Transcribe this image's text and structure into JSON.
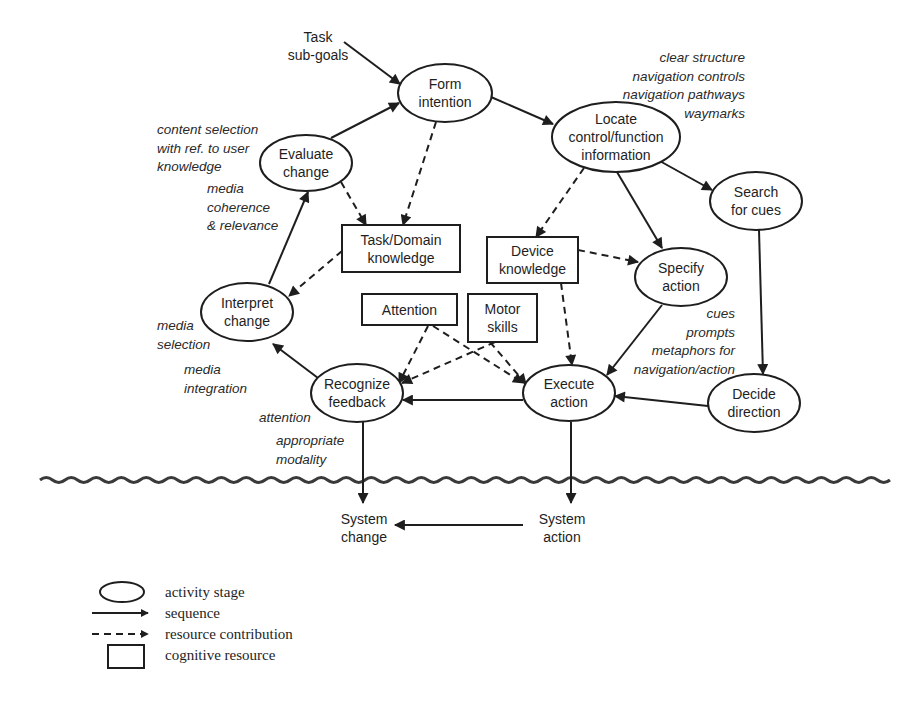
{
  "diagram": {
    "title": "",
    "colors": {
      "ink": "#1e1e1e",
      "background": "#ffffff"
    },
    "activity_stages": [
      {
        "id": "form",
        "lines": [
          "Form",
          "intention"
        ],
        "cx": 445,
        "cy": 93,
        "rx": 47,
        "ry": 29
      },
      {
        "id": "locate",
        "lines": [
          "Locate",
          "control/function",
          "information"
        ],
        "cx": 616,
        "cy": 137,
        "rx": 64,
        "ry": 35
      },
      {
        "id": "search",
        "lines": [
          "Search",
          "for cues"
        ],
        "cx": 756,
        "cy": 201,
        "rx": 46,
        "ry": 29
      },
      {
        "id": "evaluate",
        "lines": [
          "Evaluate",
          "change"
        ],
        "cx": 306,
        "cy": 163,
        "rx": 46,
        "ry": 28
      },
      {
        "id": "specify",
        "lines": [
          "Specify",
          "action"
        ],
        "cx": 681,
        "cy": 277,
        "rx": 46,
        "ry": 29
      },
      {
        "id": "interpret",
        "lines": [
          "Interpret",
          "change"
        ],
        "cx": 247,
        "cy": 312,
        "rx": 46,
        "ry": 29
      },
      {
        "id": "recognize",
        "lines": [
          "Recognize",
          "feedback"
        ],
        "cx": 357,
        "cy": 393,
        "rx": 46,
        "ry": 29
      },
      {
        "id": "execute",
        "lines": [
          "Execute",
          "action"
        ],
        "cx": 569,
        "cy": 393,
        "rx": 46,
        "ry": 28
      },
      {
        "id": "decide",
        "lines": [
          "Decide",
          "direction"
        ],
        "cx": 754,
        "cy": 403,
        "rx": 46,
        "ry": 29
      }
    ],
    "cognitive_resources": [
      {
        "id": "taskdomain",
        "lines": [
          "Task/Domain",
          "knowledge"
        ],
        "x": 342,
        "y": 225,
        "w": 118,
        "h": 47
      },
      {
        "id": "device",
        "lines": [
          "Device",
          "knowledge"
        ],
        "x": 487,
        "y": 237,
        "w": 91,
        "h": 46
      },
      {
        "id": "attention",
        "lines": [
          "Attention"
        ],
        "x": 362,
        "y": 294,
        "w": 95,
        "h": 31
      },
      {
        "id": "motor",
        "lines": [
          "Motor",
          "skills"
        ],
        "x": 468,
        "y": 294,
        "w": 69,
        "h": 48
      }
    ],
    "plain_labels": [
      {
        "id": "task-subgoals",
        "lines": [
          "Task",
          "sub-goals"
        ],
        "x": 318,
        "y": 42
      },
      {
        "id": "system-change",
        "lines": [
          "System",
          "change"
        ],
        "x": 364,
        "y": 524
      },
      {
        "id": "system-action",
        "lines": [
          "System",
          "action"
        ],
        "x": 562,
        "y": 524
      }
    ],
    "sequence_edges": [
      {
        "from": "Task sub-goals",
        "to": "Form intention",
        "points": [
          [
            344,
            42
          ],
          [
            400,
            84
          ]
        ]
      },
      {
        "from": "Evaluate change",
        "to": "Form intention",
        "points": [
          [
            331,
            138
          ],
          [
            399,
            103
          ]
        ]
      },
      {
        "from": "Form intention",
        "to": "Locate control/function information",
        "points": [
          [
            491,
            97
          ],
          [
            553,
            124
          ]
        ]
      },
      {
        "from": "Locate control/function information",
        "to": "Search for cues",
        "points": [
          [
            658,
            160
          ],
          [
            712,
            190
          ]
        ]
      },
      {
        "from": "Locate control/function information",
        "to": "Specify action",
        "points": [
          [
            617,
            172
          ],
          [
            662,
            248
          ]
        ]
      },
      {
        "from": "Search for cues",
        "to": "Decide direction",
        "points": [
          [
            759,
            230
          ],
          [
            763,
            374
          ]
        ]
      },
      {
        "from": "Interpret change",
        "to": "Evaluate change",
        "points": [
          [
            269,
            284
          ],
          [
            308,
            192
          ]
        ]
      },
      {
        "from": "Specify action",
        "to": "Execute action",
        "points": [
          [
            662,
            305
          ],
          [
            607,
            375
          ]
        ]
      },
      {
        "from": "Decide direction",
        "to": "Execute action",
        "points": [
          [
            708,
            406
          ],
          [
            615,
            396
          ]
        ]
      },
      {
        "from": "Execute action",
        "to": "Recognize feedback",
        "points": [
          [
            523,
            400
          ],
          [
            403,
            400
          ]
        ]
      },
      {
        "from": "Recognize feedback",
        "to": "Interpret change",
        "points": [
          [
            318,
            378
          ],
          [
            273,
            344
          ]
        ]
      },
      {
        "from": "Recognize feedback",
        "to": "System change",
        "points": [
          [
            363,
            422
          ],
          [
            363,
            503
          ]
        ]
      },
      {
        "from": "Execute action",
        "to": "System action",
        "points": [
          [
            571,
            422
          ],
          [
            571,
            503
          ]
        ]
      },
      {
        "from": "System action",
        "to": "System change",
        "points": [
          [
            523,
            525
          ],
          [
            395,
            525
          ]
        ]
      }
    ],
    "resource_edges": [
      {
        "from": "Form intention",
        "to": "Task/Domain knowledge",
        "points": [
          [
            436,
            122
          ],
          [
            403,
            225
          ]
        ]
      },
      {
        "from": "Evaluate change",
        "to": "Task/Domain knowledge",
        "points": [
          [
            341,
            182
          ],
          [
            366,
            225
          ]
        ]
      },
      {
        "from": "Task/Domain knowledge",
        "to": "Interpret change",
        "points": [
          [
            342,
            251
          ],
          [
            289,
            296
          ]
        ]
      },
      {
        "from": "Locate control/function information",
        "to": "Device knowledge",
        "points": [
          [
            584,
            168
          ],
          [
            536,
            237
          ]
        ]
      },
      {
        "from": "Device knowledge",
        "to": "Specify action",
        "points": [
          [
            578,
            250
          ],
          [
            638,
            262
          ]
        ]
      },
      {
        "from": "Device knowledge",
        "to": "Execute action",
        "points": [
          [
            561,
            283
          ],
          [
            572,
            365
          ]
        ]
      },
      {
        "from": "Attention",
        "to": "Recognize feedback",
        "points": [
          [
            428,
            326
          ],
          [
            399,
            383
          ]
        ]
      },
      {
        "from": "Attention",
        "to": "Execute action",
        "points": [
          [
            433,
            326
          ],
          [
            523,
            383
          ]
        ]
      },
      {
        "from": "Motor skills",
        "to": "Recognize feedback",
        "points": [
          [
            495,
            342
          ],
          [
            402,
            383
          ]
        ]
      },
      {
        "from": "Motor skills",
        "to": "Execute action",
        "points": [
          [
            490,
            342
          ],
          [
            526,
            384
          ]
        ]
      }
    ],
    "annotations": [
      {
        "id": "note-locate",
        "anchor": "end",
        "x": 745,
        "y": 62,
        "lines": [
          "clear structure",
          "navigation controls",
          "navigation pathways",
          "waymarks"
        ]
      },
      {
        "id": "note-evaluate-content",
        "anchor": "start",
        "x": 157,
        "y": 134,
        "lines": [
          "content selection",
          "with ref. to user",
          "knowledge"
        ]
      },
      {
        "id": "note-evaluate-media",
        "anchor": "start",
        "x": 207,
        "y": 193,
        "lines": [
          "media",
          "coherence",
          "& relevance"
        ]
      },
      {
        "id": "note-interpret-selection",
        "anchor": "start",
        "x": 157,
        "y": 330,
        "lines": [
          "media",
          "selection"
        ]
      },
      {
        "id": "note-interpret-integration",
        "anchor": "start",
        "x": 184,
        "y": 374,
        "lines": [
          "media",
          "integration"
        ]
      },
      {
        "id": "note-recognize-attention",
        "anchor": "start",
        "x": 259,
        "y": 422,
        "lines": [
          "attention"
        ]
      },
      {
        "id": "note-recognize-modality",
        "anchor": "start",
        "x": 276,
        "y": 445,
        "lines": [
          "appropriate",
          "modality"
        ]
      },
      {
        "id": "note-specify",
        "anchor": "end",
        "x": 735,
        "y": 318,
        "lines": [
          "cues",
          "prompts",
          "metaphors for",
          "navigation/action"
        ]
      }
    ],
    "system_boundary": {
      "x1": 40,
      "x2": 880,
      "y": 480,
      "wavelength": 25,
      "amplitude": 2.5
    },
    "legend": [
      {
        "symbol": "ellipse",
        "label": "activity stage"
      },
      {
        "symbol": "solid-arrow",
        "label": "sequence"
      },
      {
        "symbol": "dashed-arrow",
        "label": "resource contribution"
      },
      {
        "symbol": "rectangle",
        "label": "cognitive resource"
      }
    ]
  }
}
